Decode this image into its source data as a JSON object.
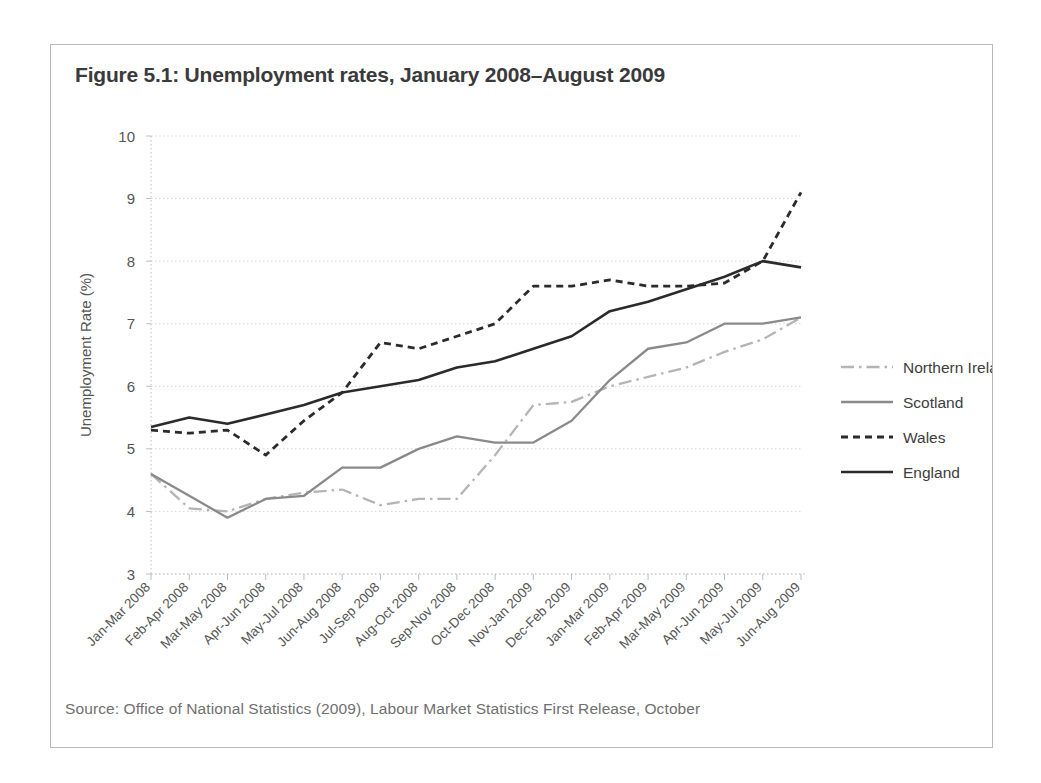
{
  "figure": {
    "title": "Figure 5.1: Unemployment rates, January 2008–August 2009",
    "source": "Source: Office of National Statistics (2009), Labour Market Statistics First Release, October"
  },
  "colors": {
    "england": "#2b2b2b",
    "wales": "#2b2b2b",
    "scotland": "#8a8a8a",
    "northern_ireland": "#b4b4b4",
    "grid": "#d8d8d8",
    "axis": "#bdbdbd",
    "text": "#555555",
    "frame": "#b9b9b9"
  },
  "chart_data": {
    "type": "line",
    "title": "Figure 5.1: Unemployment rates, January 2008–August 2009",
    "xlabel": "",
    "ylabel": "Unemployment Rate (%)",
    "ylim": [
      3,
      10
    ],
    "ytick_labels": [
      "10",
      "9",
      "8",
      "7",
      "6",
      "5",
      "4",
      "3"
    ],
    "yticks": [
      10,
      9,
      8,
      7,
      6,
      5,
      4,
      3
    ],
    "grid": true,
    "legend_position": "right",
    "categories": [
      "Jan-Mar 2008",
      "Feb-Apr 2008",
      "Mar-May 2008",
      "Apr-Jun 2008",
      "May-Jul 2008",
      "Jun-Aug 2008",
      "Jul-Sep 2008",
      "Aug-Oct 2008",
      "Sep-Nov 2008",
      "Oct-Dec 2008",
      "Nov-Jan 2009",
      "Dec-Feb 2009",
      "Jan-Mar 2009",
      "Feb-Apr 2009",
      "Mar-May 2009",
      "Apr-Jun 2009",
      "May-Jul 2009",
      "Jun-Aug 2009"
    ],
    "series": [
      {
        "name": "Northern Ireland",
        "style": "dash-dot",
        "color": "#b4b4b4",
        "values": [
          4.6,
          4.05,
          4.0,
          4.2,
          4.3,
          4.35,
          4.1,
          4.2,
          4.2,
          4.9,
          5.7,
          5.75,
          6.0,
          6.15,
          6.3,
          6.55,
          6.75,
          7.1
        ]
      },
      {
        "name": "Scotland",
        "style": "solid",
        "color": "#8a8a8a",
        "values": [
          4.6,
          4.25,
          3.9,
          4.2,
          4.25,
          4.7,
          4.7,
          5.0,
          5.2,
          5.1,
          5.1,
          5.45,
          6.1,
          6.6,
          6.7,
          7.0,
          7.0,
          7.1
        ]
      },
      {
        "name": "Wales",
        "style": "dashed",
        "color": "#2b2b2b",
        "values": [
          5.3,
          5.25,
          5.3,
          4.9,
          5.45,
          5.9,
          6.7,
          6.6,
          6.8,
          7.0,
          7.6,
          7.6,
          7.7,
          7.6,
          7.6,
          7.65,
          8.0,
          9.1
        ]
      },
      {
        "name": "England",
        "style": "solid",
        "color": "#2b2b2b",
        "values": [
          5.35,
          5.5,
          5.4,
          5.55,
          5.7,
          5.9,
          6.0,
          6.1,
          6.3,
          6.4,
          6.6,
          6.8,
          7.2,
          7.35,
          7.55,
          7.75,
          8.0,
          7.9
        ]
      }
    ]
  },
  "legend": {
    "items": [
      {
        "label": "Northern Ireland"
      },
      {
        "label": "Scotland"
      },
      {
        "label": "Wales"
      },
      {
        "label": "England"
      }
    ]
  }
}
